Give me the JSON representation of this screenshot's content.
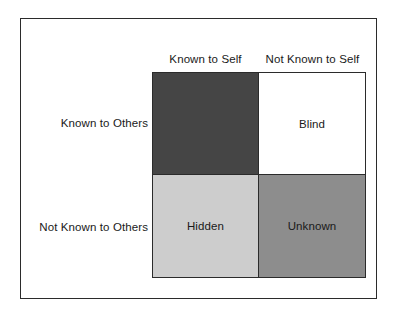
{
  "figure": {
    "kind": "johari-window"
  },
  "columns": [
    {
      "id": "known-to-self",
      "label": "Known to Self"
    },
    {
      "id": "not-known-to-self",
      "label": "Not Known to Self"
    }
  ],
  "rows": [
    {
      "id": "known-to-others",
      "label": "Known to Others"
    },
    {
      "id": "not-known-to-others",
      "label": "Not Known to Others"
    }
  ],
  "quadrants": [
    {
      "id": "open",
      "label": "",
      "row": "known-to-others",
      "column": "known-to-self",
      "fill": "#454545",
      "text_color": "#ffffff"
    },
    {
      "id": "blind",
      "label": "Blind",
      "row": "known-to-others",
      "column": "not-known-to-self",
      "fill": "#ffffff",
      "text_color": "#1a1a1a"
    },
    {
      "id": "hidden",
      "label": "Hidden",
      "row": "not-known-to-others",
      "column": "known-to-self",
      "fill": "#cdcdcd",
      "text_color": "#1a1a1a"
    },
    {
      "id": "unknown",
      "label": "Unknown",
      "row": "not-known-to-others",
      "column": "not-known-to-self",
      "fill": "#8d8d8d",
      "text_color": "#1a1a1a"
    }
  ],
  "colors": {
    "background": "#ffffff",
    "border": "#2b2b2b",
    "text": "#1a1a1a"
  }
}
